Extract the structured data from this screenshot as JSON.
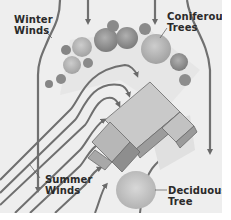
{
  "diagram": {
    "type": "landscaping-wind-diagram",
    "style": "grayscale illustration",
    "labels": {
      "winter_winds": [
        "Winter",
        "Winds"
      ],
      "coniferous_trees": [
        "Coniferous",
        "Trees"
      ],
      "summer_winds": [
        "Summer",
        "Winds"
      ],
      "deciduous_tree": [
        "Deciduous",
        "Tree"
      ]
    },
    "colors": {
      "background": "#eeeeee",
      "margin": "#ffffff",
      "arrow": "#707070",
      "tree_dark": "#8a8a8a",
      "tree_light": "#b5b5b5",
      "roof_light": "#c8c8c8",
      "roof_dark": "#9a9a9a",
      "shadow": "#dcdcdc",
      "text": "#2a2a2a"
    }
  }
}
